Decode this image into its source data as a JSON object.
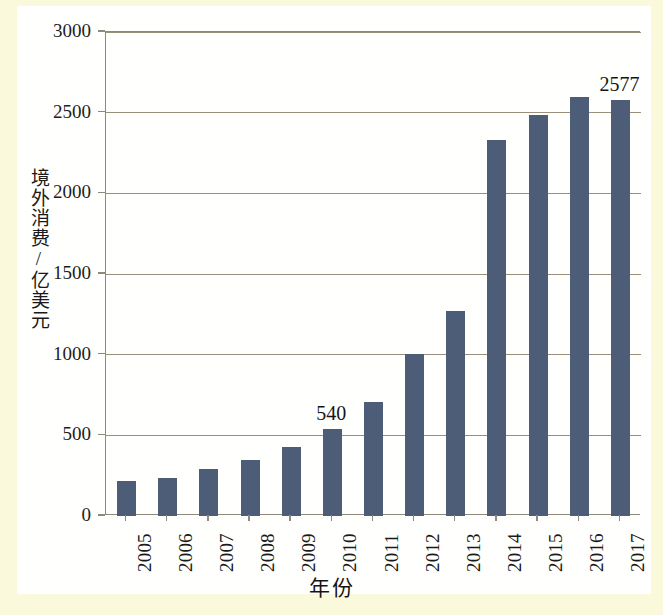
{
  "chart_data": {
    "type": "bar",
    "title": "",
    "xlabel": "年份",
    "ylabel": "境外消费/亿美元",
    "categories": [
      "2005",
      "2006",
      "2007",
      "2008",
      "2009",
      "2010",
      "2011",
      "2012",
      "2013",
      "2014",
      "2015",
      "2016",
      "2017"
    ],
    "values": [
      218,
      235,
      290,
      350,
      425,
      540,
      705,
      1005,
      1270,
      2330,
      2485,
      2600,
      2577
    ],
    "ylim": [
      0,
      3000
    ],
    "yticks": [
      0,
      500,
      1000,
      1500,
      2000,
      2500,
      3000
    ],
    "ytick_labels": [
      "0",
      "500",
      "1000",
      "1500",
      "2000",
      "2500",
      "3000"
    ],
    "grid": true,
    "legend": "none",
    "bar_color": "#4d5c77",
    "grid_color": "#9a8f7d",
    "axis_color": "#8d8a7c",
    "annotations": [
      {
        "category": "2010",
        "text": "540"
      },
      {
        "category": "2017",
        "text": "2577"
      }
    ]
  },
  "page": {
    "background_color": "#fbf9dc",
    "sheet_color": "#fffffd"
  }
}
